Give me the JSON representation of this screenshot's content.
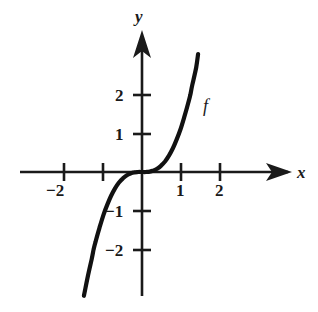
{
  "chart_data": {
    "type": "line",
    "title": "",
    "xlabel": "x",
    "ylabel": "y",
    "curve_label": "f",
    "xlim": [
      -2.9,
      3.6
    ],
    "ylim": [
      -3.0,
      3.5
    ],
    "grid": false,
    "legend": "none",
    "axis_style": "cartesian-arrows",
    "annotations": [
      {
        "text": "f",
        "x": 1.45,
        "y": 1.75
      }
    ],
    "xticks": [
      -2,
      -1,
      1,
      2
    ],
    "xtick_labels": [
      "−2",
      "",
      "1",
      "2"
    ],
    "yticks": [
      -2,
      -1,
      1,
      2
    ],
    "ytick_labels": [
      "−2",
      "−1",
      "1",
      "2"
    ],
    "series": [
      {
        "name": "f",
        "description": "odd power function, steep cubic-like curve through the origin",
        "x": [
          -1.5,
          -1.4,
          -1.3,
          -1.25,
          -1.2,
          -1.1,
          -1.0,
          -0.9,
          -0.8,
          -0.7,
          -0.6,
          -0.5,
          -0.4,
          -0.3,
          -0.2,
          -0.1,
          0.0,
          0.1,
          0.2,
          0.3,
          0.4,
          0.5,
          0.6,
          0.7,
          0.8,
          0.9,
          1.0,
          1.1,
          1.2,
          1.25,
          1.3,
          1.4,
          1.45
        ],
        "y": [
          -3.2,
          -2.7,
          -2.25,
          -2.0,
          -1.8,
          -1.45,
          -1.12,
          -0.85,
          -0.62,
          -0.43,
          -0.28,
          -0.17,
          -0.09,
          -0.04,
          -0.01,
          0.0,
          0.0,
          0.0,
          0.01,
          0.04,
          0.09,
          0.17,
          0.28,
          0.43,
          0.62,
          0.85,
          1.12,
          1.45,
          1.8,
          2.0,
          2.25,
          2.7,
          3.05
        ]
      }
    ]
  },
  "axes": {
    "x_axis_label": "x",
    "y_axis_label": "y",
    "x_tick_labels": [
      {
        "value": "−2",
        "x": -2
      },
      {
        "value": "1",
        "x": 1
      },
      {
        "value": "2",
        "x": 2
      }
    ],
    "y_tick_labels": [
      {
        "value": "2",
        "y": 2
      },
      {
        "value": "1",
        "y": 1
      },
      {
        "value": "−1",
        "y": -1
      },
      {
        "value": "−2",
        "y": -2
      }
    ]
  },
  "colors": {
    "background": "#ffffff",
    "axis": "#1a1a1a",
    "curve": "#111111",
    "text": "#1a1a1a"
  }
}
